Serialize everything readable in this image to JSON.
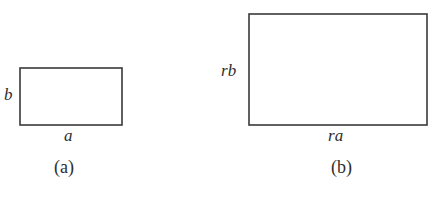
{
  "figure": {
    "background_color": "#ffffff",
    "stroke_color": "#3a3a3a",
    "text_color": "#2e2e2e",
    "subfigures": [
      {
        "caption": "(a)",
        "shape": "rectangle",
        "width_label": "a",
        "height_label": "b",
        "rect": {
          "x": 20,
          "y": 68,
          "width": 102,
          "height": 57
        }
      },
      {
        "caption": "(b)",
        "shape": "rectangle",
        "width_label": "ra",
        "height_label": "rb",
        "rect": {
          "x": 249,
          "y": 14,
          "width": 178,
          "height": 111
        }
      }
    ]
  }
}
